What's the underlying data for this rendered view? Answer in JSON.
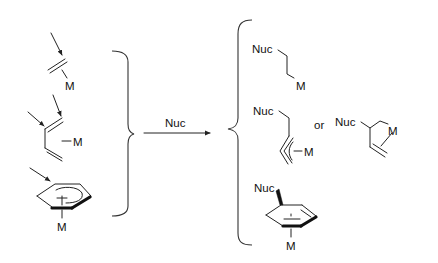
{
  "scheme": {
    "reagent_label": "Nuc",
    "reactants": [
      {
        "name": "eta2-alkene-complex",
        "metal_label": "M"
      },
      {
        "name": "eta4-diene-complex",
        "metal_label": "M"
      },
      {
        "name": "eta6-arene-complex",
        "metal_label": "M"
      }
    ],
    "products": [
      {
        "name": "alkyl-product",
        "nuc_label": "Nuc",
        "metal_label": "M"
      },
      {
        "name": "eta3-allyl-product-linear",
        "nuc_label": "Nuc",
        "metal_label": "M"
      },
      {
        "name": "eta3-allyl-product-branched",
        "nuc_label": "Nuc",
        "metal_label": "M"
      },
      {
        "name": "eta5-cyclohexadienyl-product",
        "nuc_label": "Nuc",
        "metal_label": "M"
      }
    ],
    "connector_or": "or"
  }
}
